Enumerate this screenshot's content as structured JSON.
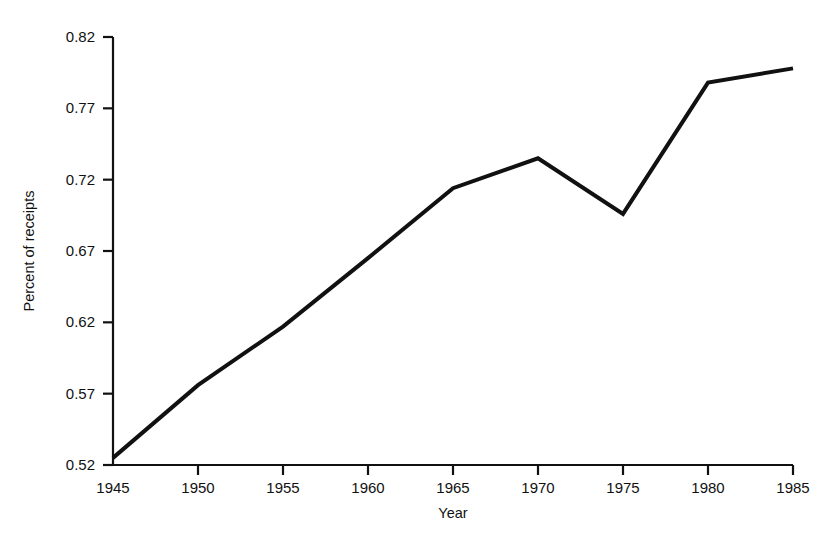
{
  "chart_data": {
    "type": "line",
    "title": "",
    "subtitle": "",
    "xlabel": "Year",
    "ylabel": "Percent of receipts",
    "x": [
      1945,
      1950,
      1955,
      1960,
      1965,
      1970,
      1975,
      1980,
      1985
    ],
    "values": [
      0.525,
      0.576,
      0.617,
      0.665,
      0.714,
      0.735,
      0.696,
      0.788,
      0.798
    ],
    "series": [
      {
        "name": "Percent of receipts",
        "values": [
          0.525,
          0.576,
          0.617,
          0.665,
          0.714,
          0.735,
          0.696,
          0.788,
          0.798
        ]
      }
    ],
    "xlim": [
      1945,
      1985
    ],
    "ylim": [
      0.52,
      0.82
    ],
    "xticks": [
      1945,
      1950,
      1955,
      1960,
      1965,
      1970,
      1975,
      1980,
      1985
    ],
    "xtick_labels": [
      "1945",
      "1950",
      "1955",
      "1960",
      "1965",
      "1970",
      "1975",
      "1980",
      "1985"
    ],
    "yticks": [
      0.52,
      0.57,
      0.62,
      0.67,
      0.72,
      0.77,
      0.82
    ],
    "ytick_labels": [
      "0.52",
      "0.57",
      "0.62",
      "0.67",
      "0.72",
      "0.77",
      "0.82"
    ],
    "grid": false,
    "legend": false,
    "legend_position": "none",
    "line_color": "#111111",
    "background_color": "#ffffff",
    "annotations": []
  },
  "axes": {
    "x_title": "Year",
    "y_title": "Percent of receipts"
  }
}
